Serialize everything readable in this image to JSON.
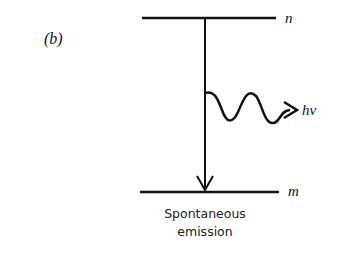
{
  "panel_label": "(b)",
  "upper_level_label": "n",
  "lower_level_label": "m",
  "photon_label": "hν",
  "caption_line1": "Spontaneous",
  "caption_line2": "emission",
  "line_color": "#111111"
}
